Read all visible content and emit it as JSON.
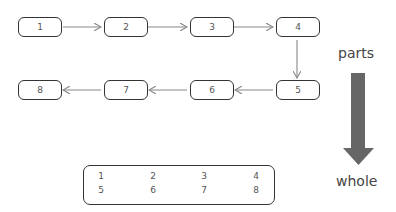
{
  "diagram": {
    "nodes": [
      {
        "id": "1",
        "label": "1"
      },
      {
        "id": "2",
        "label": "2"
      },
      {
        "id": "3",
        "label": "3"
      },
      {
        "id": "4",
        "label": "4"
      },
      {
        "id": "5",
        "label": "5"
      },
      {
        "id": "6",
        "label": "6"
      },
      {
        "id": "7",
        "label": "7"
      },
      {
        "id": "8",
        "label": "8"
      }
    ],
    "edges": [
      {
        "from": "1",
        "to": "2"
      },
      {
        "from": "2",
        "to": "3"
      },
      {
        "from": "3",
        "to": "4"
      },
      {
        "from": "4",
        "to": "5"
      },
      {
        "from": "5",
        "to": "6"
      },
      {
        "from": "6",
        "to": "7"
      },
      {
        "from": "7",
        "to": "8"
      }
    ],
    "whole_grid": [
      [
        "1",
        "2",
        "3",
        "4"
      ],
      [
        "5",
        "6",
        "7",
        "8"
      ]
    ],
    "parts_label": "parts",
    "whole_label": "whole",
    "colors": {
      "stroke": "#333333",
      "arrow": "#888888",
      "big_arrow": "#666666"
    }
  }
}
